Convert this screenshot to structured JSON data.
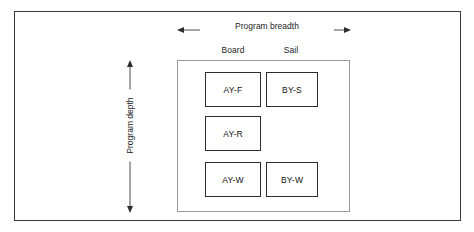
{
  "diagram": {
    "axes": {
      "horizontal": {
        "label": "Program breadth",
        "icon_left": "arrow-left-icon",
        "icon_right": "arrow-right-icon"
      },
      "vertical": {
        "label": "Program depth",
        "icon_top": "arrow-up-icon",
        "icon_bottom": "arrow-down-icon"
      }
    },
    "columns": [
      {
        "id": "board",
        "label": "Board"
      },
      {
        "id": "sail",
        "label": "Sail"
      }
    ],
    "rows": [
      {
        "id": "freeride",
        "label": "Freeride"
      },
      {
        "id": "race",
        "label": "Race"
      },
      {
        "id": "wave",
        "label": "Wave"
      }
    ],
    "cells": [
      {
        "row": "freeride",
        "column": "board",
        "label": "AY-F",
        "empty": false
      },
      {
        "row": "freeride",
        "column": "sail",
        "label": "BY-S",
        "empty": false
      },
      {
        "row": "race",
        "column": "board",
        "label": "AY-R",
        "empty": false
      },
      {
        "row": "race",
        "column": "sail",
        "label": "",
        "empty": true
      },
      {
        "row": "wave",
        "column": "board",
        "label": "AY-W",
        "empty": false
      },
      {
        "row": "wave",
        "column": "sail",
        "label": "BY-W",
        "empty": false
      }
    ],
    "colors": {
      "outer_frame": "#3a3a3a",
      "container_frame": "#9a9a9a",
      "box_frame": "#2d2d2d",
      "text": "#111111",
      "background": "#ffffff"
    }
  }
}
